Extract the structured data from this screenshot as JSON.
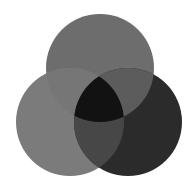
{
  "diagram": {
    "type": "venn",
    "set_count": 3,
    "background": "#ffffff",
    "circles": [
      {
        "id": "top",
        "cx": 100,
        "cy": 68,
        "r": 54,
        "fill": "#6d6d6d"
      },
      {
        "id": "left",
        "cx": 70,
        "cy": 122,
        "r": 54,
        "fill": "#7b7b7b"
      },
      {
        "id": "right",
        "cx": 128,
        "cy": 122,
        "r": 54,
        "fill": "#2b2b2b"
      }
    ],
    "regions": {
      "top_left": "#767676",
      "top_right": "#5c5c5c",
      "left_right": "#474747",
      "center": "#121212"
    }
  }
}
